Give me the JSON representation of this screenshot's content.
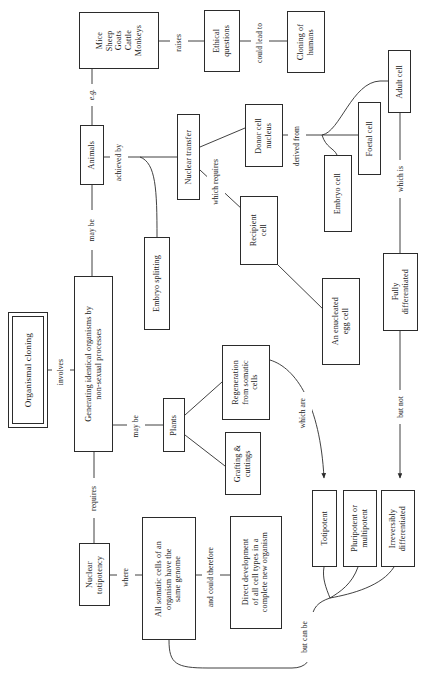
{
  "diagram": {
    "orientation": "rotated-90-ccw",
    "nodes": {
      "root": "Organismal cloning",
      "definition": "Generating identical organisms by\nnon-sexual processes",
      "animals": "Animals",
      "species_list": "Mice\nSheep\nGoats\nCattle\nMonkeys",
      "ethical_questions": "Ethical\nquestions",
      "cloning_humans": "Cloning of\nhumans",
      "nuclear_transfer": "Nuclear transfer",
      "embryo_splitting": "Embryo splitting",
      "donor_cell_nucleus": "Donor cell\nnucleus",
      "recipient_cell": "Recipient\ncell",
      "enucleated_egg": "An enucleated\negg cell",
      "embryo_cell": "Embryo cell",
      "foetal_cell": "Foetal cell",
      "adult_cell": "Adult cell",
      "fully_differentiated": "Fully\ndifferentiated",
      "plants": "Plants",
      "regeneration": "Regeneration\nfrom somatic\ncells",
      "grafting": "Grafting &\ncuttings",
      "nuclear_totipotency": "Nuclear\ntotipotency",
      "somatic_genome": "All somatic cells of an\norganism have the\nsame genome",
      "direct_development": "Direct development\nof all cell types in a\ncomplete new organism",
      "totipotent": "Totipotent",
      "pluripotent": "Pluripotent or\nmultipotent",
      "irreversibly_differentiated": "Irreversibly\ndifferentiated"
    },
    "edge_labels": {
      "involves": "involves",
      "may_be_animals": "may be",
      "eg": "e.g.",
      "raises": "raises",
      "could_lead_to": "could lead to",
      "achieved_by": "achieved by",
      "which_requires": "which requires",
      "derived_from": "derived from",
      "which_is": "which is",
      "may_be_plants": "may be",
      "which_are": "which are",
      "but_not": "but not",
      "requires": "requires",
      "where": "where",
      "and_could_therefore": "and could therefore",
      "but_can_be": "but can be"
    },
    "colors": {
      "ink": "#2b2b2b",
      "background": "#ffffff"
    }
  }
}
